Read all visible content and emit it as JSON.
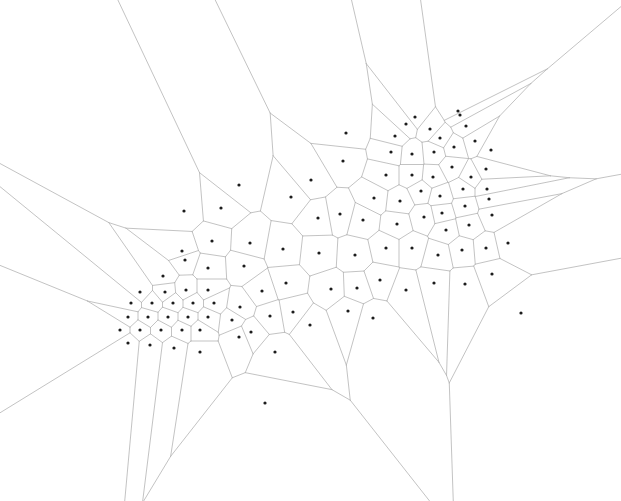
{
  "figure": {
    "title": "",
    "type": "voronoi-diagram",
    "width": 621,
    "height": 501,
    "background_color": "#ffffff",
    "edge_color": "#b4b4b4",
    "edge_width": 0.8,
    "point_color": "#1c1c1c",
    "point_radius": 1.6
  },
  "chart_data": {
    "type": "scatter",
    "title": "",
    "xlabel": "",
    "ylabel": "",
    "xlim": [
      0,
      621
    ],
    "ylim": [
      0,
      501
    ],
    "grid": false,
    "legend": "none",
    "series": [
      {
        "name": "seed-points",
        "marker": "square-dot",
        "color": "#1c1c1c",
        "points": [
          [
            239,
            185
          ],
          [
            184,
            211
          ],
          [
            221,
            208
          ],
          [
            291,
            197
          ],
          [
            343,
            161
          ],
          [
            311,
            180
          ],
          [
            346,
            133
          ],
          [
            395,
            136
          ],
          [
            415,
            117
          ],
          [
            406,
            124
          ],
          [
            430,
            129
          ],
          [
            458,
            111
          ],
          [
            440,
            138
          ],
          [
            466,
            126
          ],
          [
            391,
            152
          ],
          [
            412,
            154
          ],
          [
            434,
            152
          ],
          [
            454,
            147
          ],
          [
            475,
            141
          ],
          [
            491,
            150
          ],
          [
            386,
            175
          ],
          [
            412,
            175
          ],
          [
            433,
            177
          ],
          [
            452,
            167
          ],
          [
            471,
            177
          ],
          [
            486,
            169
          ],
          [
            463,
            189
          ],
          [
            487,
            189
          ],
          [
            421,
            191
          ],
          [
            440,
            196
          ],
          [
            400,
            201
          ],
          [
            442,
            213
          ],
          [
            465,
            206
          ],
          [
            489,
            199
          ],
          [
            424,
            217
          ],
          [
            446,
            230
          ],
          [
            469,
            225
          ],
          [
            492,
            215
          ],
          [
            397,
            224
          ],
          [
            374,
            198
          ],
          [
            363,
            220
          ],
          [
            340,
            214
          ],
          [
            318,
            218
          ],
          [
            283,
            249
          ],
          [
            250,
            243
          ],
          [
            212,
            241
          ],
          [
            182,
            251
          ],
          [
            208,
            268
          ],
          [
            244,
            266
          ],
          [
            319,
            253
          ],
          [
            355,
            255
          ],
          [
            386,
            248
          ],
          [
            412,
            248
          ],
          [
            438,
            255
          ],
          [
            462,
            250
          ],
          [
            486,
            248
          ],
          [
            508,
            243
          ],
          [
            331,
            289
          ],
          [
            357,
            288
          ],
          [
            380,
            280
          ],
          [
            406,
            290
          ],
          [
            434,
            283
          ],
          [
            465,
            284
          ],
          [
            492,
            274
          ],
          [
            521,
            313
          ],
          [
            185,
            260
          ],
          [
            163,
            276
          ],
          [
            140,
            292
          ],
          [
            165,
            292
          ],
          [
            186,
            290
          ],
          [
            208,
            290
          ],
          [
            131,
            303
          ],
          [
            152,
            303
          ],
          [
            173,
            303
          ],
          [
            193,
            303
          ],
          [
            214,
            303
          ],
          [
            240,
            307
          ],
          [
            128,
            317
          ],
          [
            148,
            317
          ],
          [
            168,
            317
          ],
          [
            188,
            317
          ],
          [
            208,
            317
          ],
          [
            232,
            320
          ],
          [
            120,
            330
          ],
          [
            140,
            330
          ],
          [
            161,
            330
          ],
          [
            182,
            330
          ],
          [
            200,
            330
          ],
          [
            239,
            337
          ],
          [
            128,
            343
          ],
          [
            150,
            345
          ],
          [
            174,
            348
          ],
          [
            200,
            352
          ],
          [
            275,
            352
          ],
          [
            251,
            332
          ],
          [
            270,
            316
          ],
          [
            293,
            312
          ],
          [
            262,
            291
          ],
          [
            286,
            283
          ],
          [
            310,
            325
          ],
          [
            265,
            403
          ],
          [
            348,
            311
          ],
          [
            373,
            318
          ],
          [
            460,
            115
          ]
        ]
      }
    ]
  },
  "canvas": {
    "name": "voronoi-plot-canvas",
    "alt": "Voronoi diagram"
  }
}
